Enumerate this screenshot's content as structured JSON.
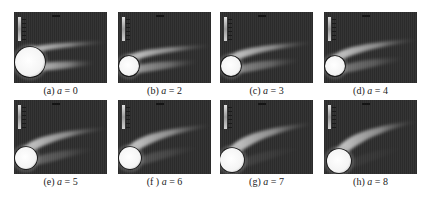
{
  "figure": {
    "panels": [
      {
        "id": "a",
        "label": "(a)",
        "var": "a",
        "eq": "=",
        "value": "0",
        "x": 14,
        "y": 12,
        "h": 71,
        "cx": 16,
        "cy": 50,
        "r": 15,
        "tilt": 0
      },
      {
        "id": "b",
        "label": "(b)",
        "var": "a",
        "eq": "=",
        "value": "2",
        "x": 118,
        "y": 12,
        "h": 71,
        "cx": 11,
        "cy": 54,
        "r": 10,
        "tilt": 2
      },
      {
        "id": "c",
        "label": "(c)",
        "var": "a",
        "eq": "=",
        "value": "3",
        "x": 220,
        "y": 12,
        "h": 71,
        "cx": 11,
        "cy": 54,
        "r": 10,
        "tilt": 3
      },
      {
        "id": "d",
        "label": "(d)",
        "var": "a",
        "eq": "=",
        "value": "4",
        "x": 324,
        "y": 12,
        "h": 71,
        "cx": 11,
        "cy": 54,
        "r": 10,
        "tilt": 4
      },
      {
        "id": "e",
        "label": "(e)",
        "var": "a",
        "eq": "=",
        "value": "5",
        "x": 14,
        "y": 100,
        "h": 74,
        "cx": 12,
        "cy": 58,
        "r": 11,
        "tilt": 5
      },
      {
        "id": "f",
        "label": "(f )",
        "var": "a",
        "eq": "=",
        "value": "6",
        "x": 118,
        "y": 100,
        "h": 74,
        "cx": 12,
        "cy": 58,
        "r": 11,
        "tilt": 6
      },
      {
        "id": "g",
        "label": "(g)",
        "var": "a",
        "eq": "=",
        "value": "7",
        "x": 220,
        "y": 100,
        "h": 74,
        "cx": 12,
        "cy": 60,
        "r": 12,
        "tilt": 7
      },
      {
        "id": "h",
        "label": "(h)",
        "var": "a",
        "eq": "=",
        "value": "8",
        "x": 324,
        "y": 100,
        "h": 74,
        "cx": 15,
        "cy": 61,
        "r": 12,
        "tilt": 8
      }
    ],
    "colors": {
      "background": "#2b2b2b",
      "cylinder": "#f8f8f8",
      "wake": "#bdbdbd",
      "caption_text": "#222222"
    }
  }
}
